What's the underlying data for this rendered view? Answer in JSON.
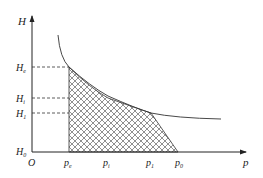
{
  "diagram": {
    "axes": {
      "y_label": "H",
      "x_label": "p",
      "origin_label": "O"
    },
    "y_ticks": [
      {
        "base": "H",
        "sub": "e"
      },
      {
        "base": "H",
        "sub": "i"
      },
      {
        "base": "H",
        "sub": "1"
      },
      {
        "base": "H",
        "sub": "0"
      }
    ],
    "x_ticks": [
      {
        "base": "p",
        "sub": "e"
      },
      {
        "base": "p",
        "sub": "i"
      },
      {
        "base": "p",
        "sub": "1"
      },
      {
        "base": "p",
        "sub": "0"
      }
    ],
    "colors": {
      "line": "#333333",
      "hatch": "#444444",
      "background": "#ffffff"
    }
  }
}
